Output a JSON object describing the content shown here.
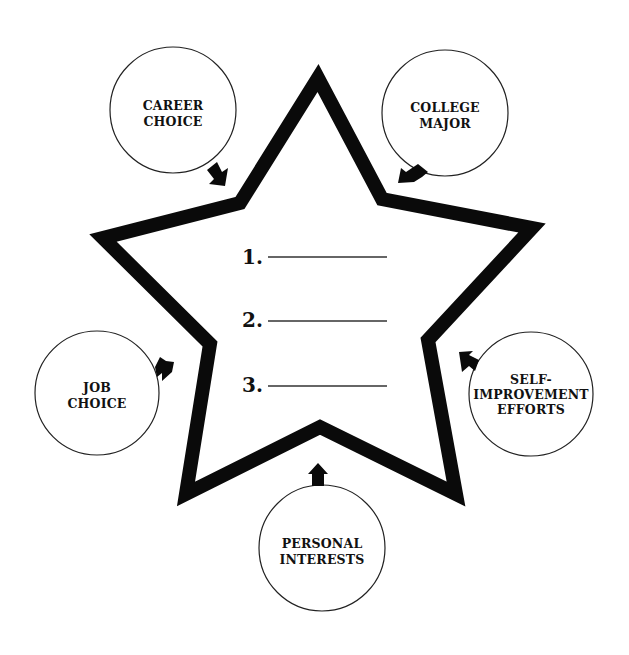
{
  "diagram": {
    "type": "star-influence-worksheet",
    "center": {
      "shape": "five-point-star",
      "list": [
        {
          "number": "1.",
          "blank": ""
        },
        {
          "number": "2.",
          "blank": ""
        },
        {
          "number": "3.",
          "blank": ""
        }
      ]
    },
    "influences": [
      {
        "id": "career-choice",
        "lines": [
          "CAREER",
          "CHOICE"
        ]
      },
      {
        "id": "college-major",
        "lines": [
          "COLLEGE",
          "MAJOR"
        ]
      },
      {
        "id": "job-choice",
        "lines": [
          "JOB",
          "CHOICE"
        ]
      },
      {
        "id": "self-improvement-efforts",
        "lines": [
          "SELF-",
          "IMPROVEMENT",
          "EFFORTS"
        ]
      },
      {
        "id": "personal-interests",
        "lines": [
          "PERSONAL",
          "INTERESTS"
        ]
      }
    ],
    "colors": {
      "star_stroke": "#0a0a0a",
      "circle_stroke": "#222222",
      "arrow_fill": "#0a0a0a",
      "background": "#ffffff"
    }
  }
}
